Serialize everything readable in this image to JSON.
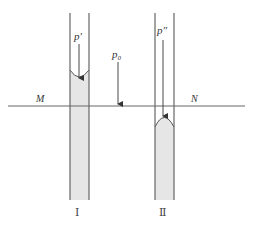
{
  "diagram": {
    "type": "capillary-tubes",
    "labels": {
      "p_prime": "p′",
      "p_zero": "p₀",
      "p_double_prime": "p″",
      "M": "M",
      "N": "N",
      "tube1": "Ⅰ",
      "tube2": "Ⅱ"
    },
    "colors": {
      "line": "#555555",
      "fill": "#e6e6e6",
      "text": "#333333"
    },
    "tube1": {
      "meniscus": "concave",
      "liquid_above_surface": true
    },
    "tube2": {
      "meniscus": "convex",
      "liquid_above_surface": false
    }
  }
}
